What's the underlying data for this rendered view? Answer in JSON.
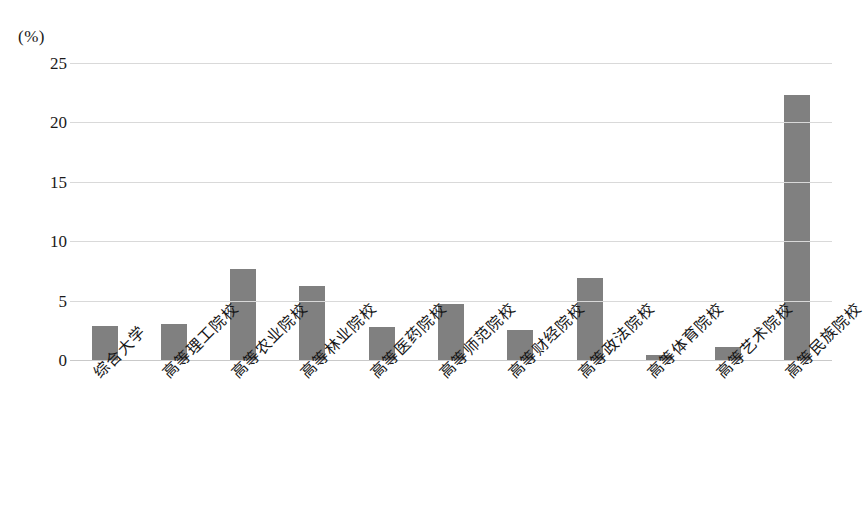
{
  "chart_data": {
    "type": "bar",
    "title": "",
    "subtitle": "",
    "xlabel": "",
    "ylabel": "",
    "unit_label": "(%)",
    "categories": [
      "综合大学",
      "高等理工院校",
      "高等农业院校",
      "高等林业院校",
      "高等医药院校",
      "高等师范院校",
      "高等财经院校",
      "高等政法院校",
      "高等体育院校",
      "高等艺术院校",
      "高等民族院校"
    ],
    "values": [
      2.9,
      3.0,
      7.7,
      6.2,
      2.8,
      4.7,
      2.5,
      6.9,
      0.4,
      1.1,
      22.3
    ],
    "ylim": [
      0,
      25
    ],
    "yticks": [
      0,
      5,
      10,
      15,
      20,
      25
    ],
    "ytick_labels": [
      "0",
      "5",
      "10",
      "15",
      "20",
      "25"
    ],
    "grid": true,
    "legend": false,
    "legend_position": "none",
    "series": [
      {
        "name": "",
        "color": "#808080",
        "values": [
          2.9,
          3.0,
          7.7,
          6.2,
          2.8,
          4.7,
          2.5,
          6.9,
          0.4,
          1.1,
          22.3
        ]
      }
    ]
  },
  "colors": {
    "bar": "#808080",
    "gridline": "#d9d9d9",
    "baseline": "#c9c9c9",
    "text": "#161616",
    "background": "#ffffff"
  }
}
